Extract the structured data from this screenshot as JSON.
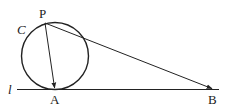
{
  "diagram": {
    "labels": {
      "circle": "C",
      "line": "l",
      "point_p": "P",
      "point_a": "A",
      "point_b": "B"
    },
    "elements": {
      "circle": {
        "name": "C",
        "cx": 55,
        "cy": 56,
        "r": 33.5
      },
      "line_l": {
        "name": "l",
        "x1": 17,
        "y1": 89.5,
        "x2": 219,
        "y2": 89.5
      },
      "point_P": {
        "x": 45,
        "y": 23
      },
      "point_A": {
        "x": 55,
        "y": 89.5
      },
      "point_B": {
        "x": 213,
        "y": 89.5
      },
      "vectors": [
        {
          "from": "P",
          "to": "A"
        },
        {
          "from": "P",
          "to": "B"
        }
      ]
    },
    "colors": {
      "stroke": "#222222",
      "background": "#ffffff"
    }
  }
}
